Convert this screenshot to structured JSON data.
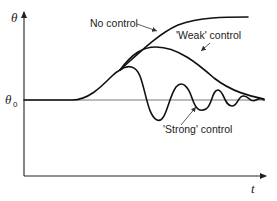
{
  "diagram": {
    "type": "control-response-curves",
    "axes": {
      "y_label": "θ",
      "x_label": "t",
      "baseline_label": "θ",
      "baseline_subscript": "0"
    },
    "curves": [
      {
        "id": "no-control",
        "label": "No control",
        "behavior": "rises from θ0 and saturates at a high plateau"
      },
      {
        "id": "weak-control",
        "label": "'Weak' control",
        "behavior": "rises, peaks, then decays slowly back toward θ0"
      },
      {
        "id": "strong-control",
        "label": "'Strong' control",
        "behavior": "rises, then damped oscillation about θ0"
      }
    ]
  }
}
